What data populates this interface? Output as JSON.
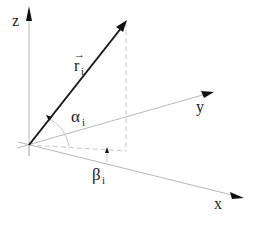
{
  "diagram": {
    "axes": {
      "x": {
        "label": "x"
      },
      "y": {
        "label": "y"
      },
      "z": {
        "label": "z"
      }
    },
    "vector": {
      "label": "r",
      "subscript": "i",
      "arrow": "→"
    },
    "angles": {
      "alpha": {
        "symbol": "α",
        "subscript": "i"
      },
      "beta": {
        "symbol": "β",
        "subscript": "i"
      }
    },
    "colors": {
      "axis": "#b8b8b8",
      "vector": "#1a1a1a",
      "dashed": "#c8c8c8",
      "text": "#222222"
    }
  }
}
